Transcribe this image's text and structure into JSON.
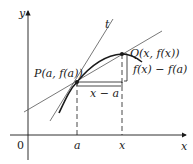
{
  "diagram": {
    "axes": {
      "x_label": "x",
      "y_label": "y",
      "origin_label": "0"
    },
    "ticks": {
      "a": "a",
      "x": "x"
    },
    "points": {
      "P": "P(a, f(a))",
      "Q": "Q(x, f(x))"
    },
    "tangent_label": "t",
    "horizontal_difference": "x − a",
    "vertical_difference": "f(x) − f(a)",
    "colors": {
      "ink": "#1a1a1a",
      "thin_line": "#555555"
    }
  }
}
